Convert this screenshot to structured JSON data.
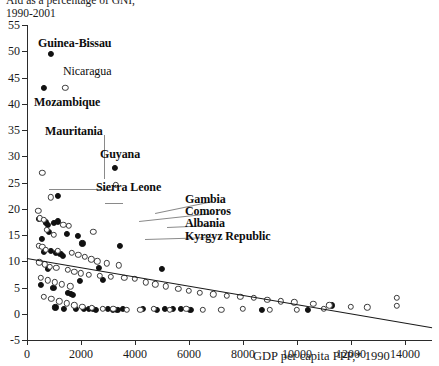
{
  "title": {
    "line1": "Aid as a percentage of GNI,",
    "line2": "1990-2001"
  },
  "axes": {
    "x_title": "GDP per capita PPP,* 1990",
    "x_ticks": [
      "0",
      "2000",
      "4000",
      "6000",
      "8000",
      "10000",
      "12000",
      "14000"
    ],
    "y_ticks": [
      "55",
      "50",
      "45",
      "40",
      "35",
      "30",
      "25",
      "20",
      "15",
      "10",
      "5",
      "0",
      "-5"
    ]
  },
  "chart_data": {
    "type": "scatter",
    "title": "Aid as a percentage of GNI, 1990-2001",
    "xlabel": "GDP per capita PPP,* 1990",
    "ylabel": "Aid as a percentage of GNI",
    "xlim": [
      0,
      15000
    ],
    "ylim": [
      -5,
      55
    ],
    "x_ticks": [
      0,
      2000,
      4000,
      6000,
      8000,
      10000,
      12000,
      14000
    ],
    "y_ticks": [
      -5,
      0,
      5,
      10,
      15,
      20,
      25,
      30,
      35,
      40,
      45,
      50,
      55
    ],
    "grid": false,
    "legend": null,
    "series": [
      {
        "name": "filled-markers",
        "marker": "filled-circle",
        "color": "#111111",
        "points": [
          [
            900,
            49.5
          ],
          [
            620,
            43.0
          ],
          [
            1150,
            22.5
          ],
          [
            1000,
            17.3
          ],
          [
            1130,
            17.6
          ],
          [
            3250,
            27.8
          ],
          [
            690,
            17.4
          ],
          [
            760,
            17.0
          ],
          [
            820,
            15.6
          ],
          [
            1480,
            15.2
          ],
          [
            1900,
            14.9
          ],
          [
            2050,
            13.4
          ],
          [
            3450,
            13.0
          ],
          [
            620,
            11.8
          ],
          [
            1080,
            11.6
          ],
          [
            1240,
            11.4
          ],
          [
            900,
            11.9
          ],
          [
            1320,
            11.0
          ],
          [
            500,
            5.5
          ],
          [
            980,
            5.0
          ],
          [
            1500,
            4.0
          ],
          [
            1620,
            3.8
          ],
          [
            1700,
            3.6
          ],
          [
            1050,
            1.2
          ],
          [
            1380,
            1.0
          ],
          [
            1820,
            0.9
          ],
          [
            2120,
            1.0
          ],
          [
            2280,
            0.9
          ],
          [
            2450,
            1.0
          ],
          [
            2560,
            0.8
          ],
          [
            3000,
            0.9
          ],
          [
            3180,
            0.7
          ],
          [
            3350,
            0.8
          ],
          [
            3550,
            0.9
          ],
          [
            4300,
            1.0
          ],
          [
            4800,
            0.8
          ],
          [
            5100,
            0.9
          ],
          [
            5400,
            1.0
          ],
          [
            5700,
            0.9
          ],
          [
            6050,
            0.8
          ],
          [
            8700,
            0.8
          ],
          [
            10400,
            0.7
          ],
          [
            11300,
            1.6
          ],
          [
            2800,
            6.5
          ],
          [
            1950,
            6.2
          ],
          [
            760,
            8.5
          ],
          [
            2650,
            8.8
          ],
          [
            5000,
            8.6
          ],
          [
            430,
            18.0
          ],
          [
            540,
            14.2
          ]
        ]
      },
      {
        "name": "hollow-markers",
        "marker": "hollow-circle",
        "color": "#ffffff",
        "points": [
          [
            1420,
            43.0
          ],
          [
            560,
            26.8
          ],
          [
            890,
            22.2
          ],
          [
            3300,
            24.6
          ],
          [
            420,
            19.6
          ],
          [
            470,
            18.2
          ],
          [
            620,
            17.9
          ],
          [
            740,
            16.0
          ],
          [
            1000,
            15.0
          ],
          [
            1340,
            17.0
          ],
          [
            1540,
            16.8
          ],
          [
            2450,
            15.6
          ],
          [
            430,
            13.0
          ],
          [
            560,
            12.7
          ],
          [
            700,
            12.2
          ],
          [
            1150,
            12.0
          ],
          [
            1650,
            11.6
          ],
          [
            1900,
            11.2
          ],
          [
            2150,
            10.8
          ],
          [
            2380,
            10.4
          ],
          [
            2600,
            10.0
          ],
          [
            2950,
            9.6
          ],
          [
            3400,
            9.2
          ],
          [
            460,
            9.8
          ],
          [
            660,
            9.4
          ],
          [
            850,
            9.0
          ],
          [
            1080,
            8.7
          ],
          [
            1500,
            8.4
          ],
          [
            1750,
            8.0
          ],
          [
            2000,
            7.7
          ],
          [
            2300,
            7.4
          ],
          [
            2700,
            7.2
          ],
          [
            3100,
            7.0
          ],
          [
            3600,
            6.8
          ],
          [
            4000,
            6.6
          ],
          [
            4400,
            6.0
          ],
          [
            4750,
            5.6
          ],
          [
            5150,
            5.2
          ],
          [
            5600,
            4.8
          ],
          [
            6000,
            4.4
          ],
          [
            6400,
            4.0
          ],
          [
            6900,
            3.7
          ],
          [
            7400,
            3.4
          ],
          [
            7900,
            3.2
          ],
          [
            8400,
            3.0
          ],
          [
            8900,
            2.7
          ],
          [
            9400,
            2.4
          ],
          [
            9900,
            2.2
          ],
          [
            10600,
            1.9
          ],
          [
            11200,
            1.6
          ],
          [
            12000,
            1.3
          ],
          [
            12600,
            1.2
          ],
          [
            13700,
            3.0
          ],
          [
            13700,
            1.5
          ],
          [
            620,
            3.2
          ],
          [
            900,
            2.8
          ],
          [
            1200,
            2.4
          ],
          [
            1480,
            2.0
          ],
          [
            1750,
            1.6
          ],
          [
            2050,
            1.3
          ],
          [
            2400,
            1.1
          ],
          [
            2800,
            1.0
          ],
          [
            3200,
            0.9
          ],
          [
            3700,
            0.8
          ],
          [
            4200,
            0.7
          ],
          [
            4700,
            0.9
          ],
          [
            5300,
            0.8
          ],
          [
            5900,
            0.9
          ],
          [
            6500,
            0.8
          ],
          [
            7200,
            0.7
          ],
          [
            8000,
            0.9
          ],
          [
            9000,
            0.8
          ],
          [
            10000,
            0.7
          ],
          [
            11000,
            0.9
          ],
          [
            520,
            6.8
          ],
          [
            760,
            6.4
          ],
          [
            1020,
            6.0
          ],
          [
            1300,
            5.6
          ],
          [
            1600,
            5.2
          ]
        ]
      }
    ],
    "trendline": {
      "x0": 0,
      "y0": 10.6,
      "x1": 15000,
      "y1": -2.6
    }
  },
  "annotations": [
    {
      "id": "guinea-bissau",
      "label": "Guinea-Bissau",
      "bold": true
    },
    {
      "id": "nicaragua",
      "label": "Nicaragua",
      "bold": false
    },
    {
      "id": "mozambique",
      "label": "Mozambique",
      "bold": true
    },
    {
      "id": "mauritania",
      "label": "Mauritania",
      "bold": true
    },
    {
      "id": "guyana",
      "label": "Guyana",
      "bold": true
    },
    {
      "id": "sierra-leone",
      "label": "Sierra Leone",
      "bold": true
    },
    {
      "id": "gambia",
      "label": "Gambia",
      "bold": true
    },
    {
      "id": "comoros",
      "label": "Comoros",
      "bold": true
    },
    {
      "id": "albania",
      "label": "Albania",
      "bold": true
    },
    {
      "id": "kyrgyz-republic",
      "label": "Kyrgyz Republic",
      "bold": true
    }
  ],
  "annotation_labels": {
    "guinea_bissau": "Guinea-Bissau",
    "nicaragua": "Nicaragua",
    "mozambique": "Mozambique",
    "mauritania": "Mauritania",
    "guyana": "Guyana",
    "sierra_leone": "Sierra Leone",
    "gambia": "Gambia",
    "comoros": "Comoros",
    "albania": "Albania",
    "kyrgyz_republic": "Kyrgyz Republic"
  }
}
